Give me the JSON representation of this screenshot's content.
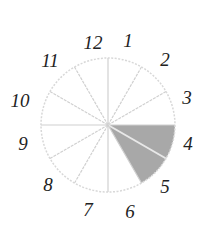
{
  "diagram": {
    "type": "clock-face-sector-diagram",
    "center": [
      108,
      125
    ],
    "radius": 67,
    "colors": {
      "outline": "#d8d8d8",
      "spoke": "#d0d0d0",
      "shade": "#a8a8a8",
      "shade_divider": "#e8e8e8",
      "numeral": "#222222"
    },
    "sectors": 12,
    "shaded_from_hour": 3,
    "shaded_to_hour": 5,
    "numerals": [
      {
        "label": "12",
        "x": 93,
        "y": 49
      },
      {
        "label": "1",
        "x": 128,
        "y": 47
      },
      {
        "label": "2",
        "x": 165,
        "y": 66
      },
      {
        "label": "3",
        "x": 187,
        "y": 104
      },
      {
        "label": "4",
        "x": 188,
        "y": 150
      },
      {
        "label": "5",
        "x": 165,
        "y": 193
      },
      {
        "label": "6",
        "x": 130,
        "y": 218
      },
      {
        "label": "7",
        "x": 88,
        "y": 216
      },
      {
        "label": "8",
        "x": 48,
        "y": 191
      },
      {
        "label": "9",
        "x": 23,
        "y": 150
      },
      {
        "label": "10",
        "x": 20,
        "y": 107
      },
      {
        "label": "11",
        "x": 50,
        "y": 67
      }
    ]
  }
}
